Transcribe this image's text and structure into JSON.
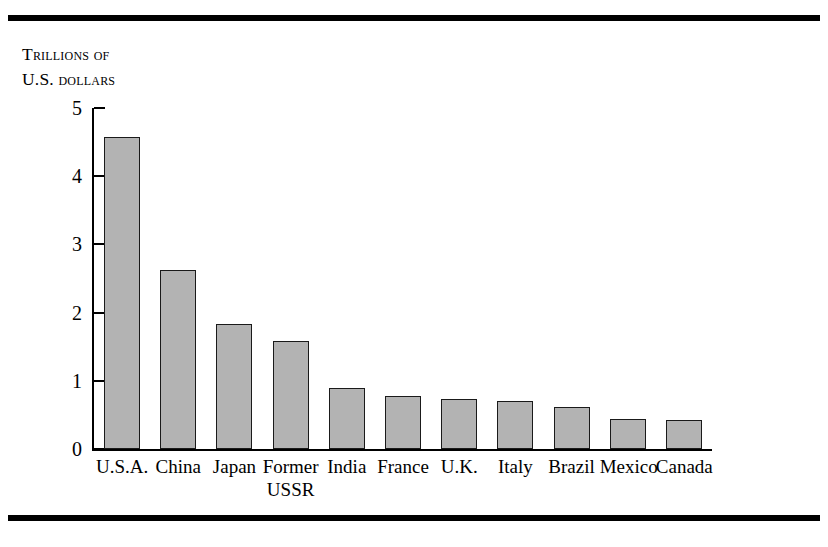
{
  "figure": {
    "axis_title_line1": "Trillions of",
    "axis_title_line2": "U.S. dollars",
    "bar_fill_color": "#b3b3b3",
    "bar_stroke_color": "#1a1a1a",
    "rule_color": "#000000"
  },
  "chart_data": {
    "type": "bar",
    "title": "",
    "subtitle": "",
    "xlabel": "",
    "ylabel": "Trillions of U.S. dollars",
    "ylim": [
      0,
      5
    ],
    "yticks": [
      "0",
      "1",
      "2",
      "3",
      "4",
      "5"
    ],
    "ytick_values": [
      0,
      1,
      2,
      3,
      4,
      5
    ],
    "grid": false,
    "legend": false,
    "categories": [
      "U.S.A.",
      "China",
      "Japan",
      "Former\nUSSR",
      "India",
      "France",
      "U.K.",
      "Italy",
      "Brazil",
      "Mexico",
      "Canada"
    ],
    "values": [
      4.58,
      2.62,
      1.84,
      1.58,
      0.9,
      0.78,
      0.73,
      0.71,
      0.61,
      0.44,
      0.42
    ]
  }
}
